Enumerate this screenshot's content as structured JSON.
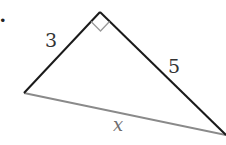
{
  "problem_marker": ".",
  "figure": {
    "type": "right-triangle",
    "vertices": {
      "right_angle": {
        "x": 100,
        "y": 12
      },
      "left": {
        "x": 24,
        "y": 93
      },
      "right": {
        "x": 226,
        "y": 135
      }
    },
    "sides": {
      "leg_left": {
        "label": "3",
        "color": "#1a1a1a"
      },
      "leg_right": {
        "label": "5",
        "color": "#1a1a1a"
      },
      "hypotenuse": {
        "label": "x",
        "color": "#8a8a8a"
      }
    },
    "right_angle_marker_color": "#9a9a9a"
  }
}
